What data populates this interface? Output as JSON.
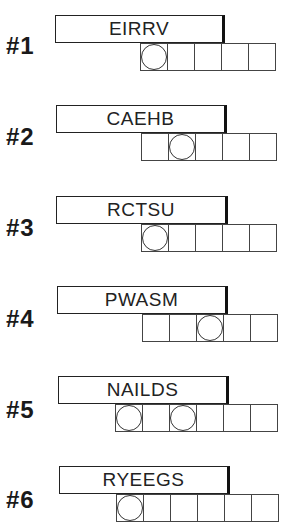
{
  "puzzles": [
    {
      "label": "#1",
      "letters": "EIRRV",
      "box_count": 5,
      "circled": [
        0
      ]
    },
    {
      "label": "#2",
      "letters": "CAEHB",
      "box_count": 5,
      "circled": [
        1
      ]
    },
    {
      "label": "#3",
      "letters": "RCTSU",
      "box_count": 5,
      "circled": [
        0
      ]
    },
    {
      "label": "#4",
      "letters": "PWASM",
      "box_count": 5,
      "circled": [
        2
      ]
    },
    {
      "label": "#5",
      "letters": "NAILDS",
      "box_count": 6,
      "circled": [
        0,
        2
      ]
    },
    {
      "label": "#6",
      "letters": "RYEEGS",
      "box_count": 6,
      "circled": [
        0
      ]
    }
  ]
}
